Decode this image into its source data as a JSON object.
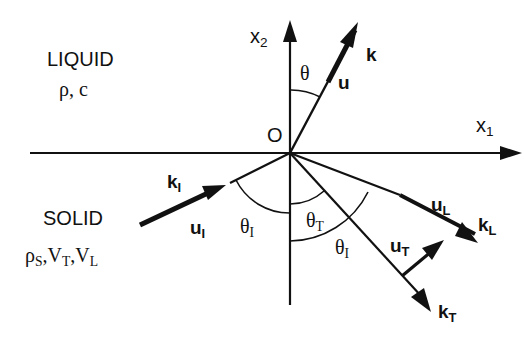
{
  "diagram": {
    "type": "wave reflection/refraction at liquid-solid interface",
    "origin": {
      "label": "O",
      "x": 290,
      "y": 153
    },
    "axes": {
      "x1": {
        "label": "x",
        "sub": "1"
      },
      "x2": {
        "label": "x",
        "sub": "2"
      }
    },
    "regions": {
      "liquid": {
        "name": "LIQUID",
        "params": "ρ, c"
      },
      "solid": {
        "name": "SOLID",
        "params_rho": "ρ",
        "params_rho_sub": "S",
        "params_vt": "V",
        "params_vt_sub": "T",
        "params_vl": "V",
        "params_vl_sub": "L"
      }
    },
    "vectors": {
      "k": {
        "label": "k"
      },
      "u": {
        "label": "u"
      },
      "kI": {
        "label": "k",
        "sub": "I"
      },
      "uI": {
        "label": "u",
        "sub": "I"
      },
      "kL": {
        "label": "k",
        "sub": "L"
      },
      "uL": {
        "label": "u",
        "sub": "L"
      },
      "kT": {
        "label": "k",
        "sub": "T"
      },
      "uT": {
        "label": "u",
        "sub": "T"
      }
    },
    "angles": {
      "theta": {
        "label": "θ"
      },
      "thetaI_left": {
        "label": "θ",
        "sub": "I"
      },
      "thetaT": {
        "label": "θ",
        "sub": "T"
      },
      "thetaI_right": {
        "label": "θ",
        "sub": "I"
      }
    },
    "colors": {
      "ink": "#111111",
      "background": "#ffffff"
    }
  }
}
